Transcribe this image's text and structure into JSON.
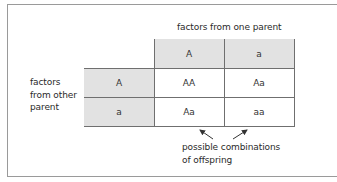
{
  "diagram": {
    "column_header_label": "factors from one parent",
    "row_header_label_lines": [
      "factors",
      "from other",
      "parent"
    ],
    "column_headers": [
      "A",
      "a"
    ],
    "row_headers": [
      "A",
      "a"
    ],
    "cells": [
      [
        "AA",
        "Aa"
      ],
      [
        "Aa",
        "aa"
      ]
    ],
    "caption_lines": [
      "possible combinations",
      "of offspring"
    ],
    "colors": {
      "header_fill": "#e2e2e2",
      "grid_line": "#6f6f6f",
      "frame_line": "#9a9a9a",
      "text": "#2a2a2a"
    }
  }
}
